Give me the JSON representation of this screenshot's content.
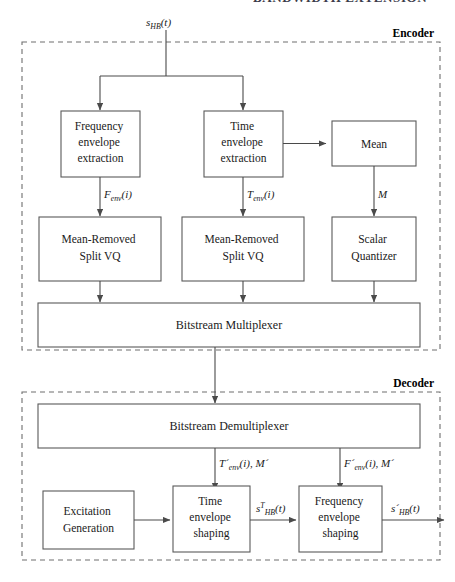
{
  "figure": {
    "page_header_fragment": "BANDWIDTH EXTENSION",
    "input_signal": {
      "base": "s",
      "sub": "HB",
      "tail": "(t)"
    },
    "sections": [
      {
        "id": "encoder",
        "label": "Encoder"
      },
      {
        "id": "decoder",
        "label": "Decoder"
      }
    ]
  },
  "encoder": {
    "blocks": [
      {
        "id": "freq-env-extraction",
        "lines": [
          "Frequency",
          "envelope",
          "extraction"
        ]
      },
      {
        "id": "time-env-extraction",
        "lines": [
          "Time",
          "envelope",
          "extraction"
        ]
      },
      {
        "id": "mean",
        "lines": [
          "Mean"
        ]
      },
      {
        "id": "mean-removed-split-vq-f",
        "lines": [
          "Mean-Removed",
          "Split VQ"
        ]
      },
      {
        "id": "mean-removed-split-vq-t",
        "lines": [
          "Mean-Removed",
          "Split VQ"
        ]
      },
      {
        "id": "scalar-quantizer",
        "lines": [
          "Scalar",
          "Quantizer"
        ]
      },
      {
        "id": "bitstream-multiplexer",
        "lines": [
          "Bitstream Multiplexer"
        ]
      }
    ],
    "signals": [
      {
        "id": "f-env",
        "base": "F",
        "sub": "env",
        "tail": "(i)"
      },
      {
        "id": "t-env",
        "base": "T",
        "sub": "env",
        "tail": "(i)"
      },
      {
        "id": "mean-value",
        "base": "M",
        "sub": "",
        "tail": ""
      }
    ]
  },
  "decoder": {
    "blocks": [
      {
        "id": "bitstream-demultiplexer",
        "lines": [
          "Bitstream Demultiplexer"
        ]
      },
      {
        "id": "excitation-generation",
        "lines": [
          "Excitation",
          "Generation"
        ]
      },
      {
        "id": "time-env-shaping",
        "lines": [
          "Time",
          "envelope",
          "shaping"
        ]
      },
      {
        "id": "freq-env-shaping",
        "lines": [
          "Frequency",
          "envelope",
          "shaping"
        ]
      }
    ],
    "signals": [
      {
        "id": "t-env-decoded",
        "base": "T´",
        "sub": "env",
        "tail": "(i), M´"
      },
      {
        "id": "f-env-decoded",
        "base": "F´",
        "sub": "env",
        "tail": "(i), M´"
      },
      {
        "id": "time-shaped-signal",
        "base": "s",
        "sup": "T",
        "sub": "HB",
        "tail": "(t)"
      },
      {
        "id": "output-signal",
        "base": "s´",
        "sub": "HB",
        "tail": "(t)"
      }
    ]
  },
  "colors": {
    "box_stroke": "#5a5a5a",
    "dashed_stroke": "#6e6e6e",
    "connector": "#4a4a4a",
    "text": "#1a1a1a",
    "background": "#ffffff"
  }
}
